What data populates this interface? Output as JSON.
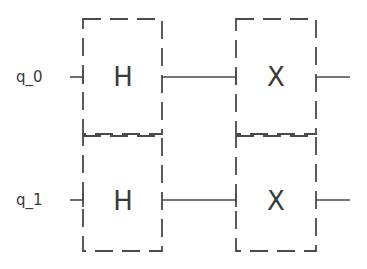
{
  "diagram": {
    "type": "quantum-circuit",
    "qubits": [
      {
        "label": "q_0"
      },
      {
        "label": "q_1"
      }
    ],
    "columns": [
      {
        "gates": [
          {
            "qubit": "q_0",
            "label": "H"
          },
          {
            "qubit": "q_1",
            "label": "H"
          }
        ]
      },
      {
        "gates": [
          {
            "qubit": "q_0",
            "label": "X"
          },
          {
            "qubit": "q_1",
            "label": "X"
          }
        ]
      }
    ],
    "colors": {
      "line": "#4a4a4a",
      "text": "#3a3a3a",
      "background": "#ffffff"
    }
  }
}
